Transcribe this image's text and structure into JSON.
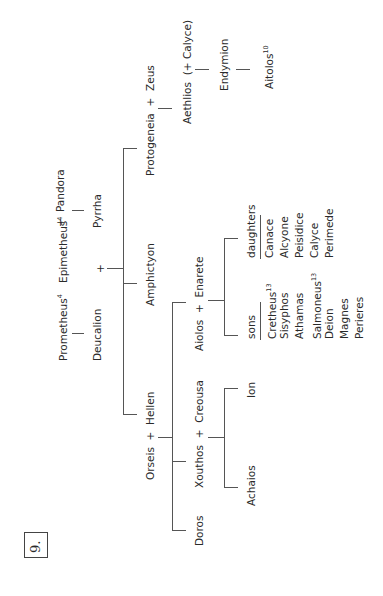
{
  "figure": {
    "number": "9.",
    "orientation": "rotated -90deg (reads bottom to top)"
  },
  "nodes": {
    "prometheus": {
      "name": "Prometheus",
      "note": "4"
    },
    "epimetheus": {
      "name": "Epimetheus",
      "note": "4"
    },
    "plus": "+",
    "pandora": "Pandora",
    "deucalion": "Deucalion",
    "pyrrha": "Pyrrha",
    "amphictyon": "Amphictyon",
    "protogeneia": "Protogeneia",
    "zeus": "Zeus",
    "aethlios": "Aethlios",
    "calyce_paren": "(+ Calyce)",
    "endymion": "Endymion",
    "aitolos": {
      "name": "Aitolos",
      "note": "10"
    },
    "orseis": "Orseis",
    "hellen": "Hellen",
    "doros": "Doros",
    "xouthos": "Xouthos",
    "creousa": "Creousa",
    "achaios": "Achaios",
    "ion": "Ion",
    "aiolos": "Aiolos",
    "enarete": "Enarete"
  },
  "aiolos_children": {
    "sons_label": "sons",
    "sons": [
      {
        "name": "Cretheus",
        "note": "13"
      },
      {
        "name": "Sisyphos",
        "note": ""
      },
      {
        "name": "Athamas",
        "note": ""
      },
      {
        "name": "Salmoneus",
        "note": "13"
      },
      {
        "name": "Deion",
        "note": ""
      },
      {
        "name": "Magnes",
        "note": ""
      },
      {
        "name": "Perieres",
        "note": ""
      }
    ],
    "daughters_label": "daughters",
    "daughters": [
      {
        "name": "Canace"
      },
      {
        "name": "Alcyone"
      },
      {
        "name": "Peisidice"
      },
      {
        "name": "Calyce"
      },
      {
        "name": "Perimede"
      }
    ]
  },
  "colors": {
    "line": "#555555",
    "text": "#2a2a2a",
    "background": "#ffffff"
  }
}
